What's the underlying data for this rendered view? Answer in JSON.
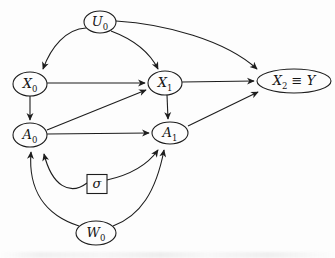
{
  "figure": {
    "background": "#fdfdfd",
    "stroke_color": "#1d1d1d",
    "text_color": "#141414",
    "type": "causal-dag",
    "nodes": [
      {
        "id": "U0",
        "shape": "ellipse",
        "cx": 100,
        "cy": 22,
        "rx": 16,
        "ry": 11,
        "label": [
          {
            "t": "U",
            "i": 1
          },
          {
            "t": "0",
            "s": 1
          }
        ]
      },
      {
        "id": "X0",
        "shape": "ellipse",
        "cx": 30,
        "cy": 84,
        "rx": 17,
        "ry": 12,
        "label": [
          {
            "t": "X",
            "i": 1
          },
          {
            "t": "0",
            "s": 1
          }
        ]
      },
      {
        "id": "X1",
        "shape": "ellipse",
        "cx": 165,
        "cy": 83,
        "rx": 17,
        "ry": 12,
        "label": [
          {
            "t": "X",
            "i": 1
          },
          {
            "t": "1",
            "s": 1
          }
        ]
      },
      {
        "id": "X2Y",
        "shape": "ellipse",
        "cx": 294,
        "cy": 81,
        "rx": 37,
        "ry": 12,
        "fs": 13,
        "label": [
          {
            "t": "X",
            "i": 1
          },
          {
            "t": "2",
            "s": 1
          },
          {
            "t": " ≡ ",
            "n": 1
          },
          {
            "t": "Y",
            "i": 1
          }
        ]
      },
      {
        "id": "A0",
        "shape": "ellipse",
        "cx": 30,
        "cy": 135,
        "rx": 17,
        "ry": 12,
        "label": [
          {
            "t": "A",
            "i": 1
          },
          {
            "t": "0",
            "s": 1
          }
        ]
      },
      {
        "id": "A1",
        "shape": "ellipse",
        "cx": 170,
        "cy": 133,
        "rx": 18,
        "ry": 11,
        "label": [
          {
            "t": "A",
            "i": 1
          },
          {
            "t": "1",
            "s": 1
          }
        ]
      },
      {
        "id": "sigma",
        "shape": "rect",
        "cx": 97,
        "cy": 184,
        "w": 20,
        "h": 19,
        "fs": 12,
        "label": [
          {
            "t": "σ",
            "i": 1
          }
        ]
      },
      {
        "id": "W0",
        "shape": "ellipse",
        "cx": 96,
        "cy": 233,
        "rx": 20,
        "ry": 12,
        "label": [
          {
            "t": "W",
            "i": 1
          },
          {
            "t": "0",
            "s": 1
          }
        ]
      }
    ],
    "edges": [
      {
        "from": "U0",
        "to": "X0",
        "d": "M86,28 C66,29 51,47 43,69"
      },
      {
        "from": "U0",
        "to": "X1",
        "d": "M111,31 C135,40 150,53 158,69"
      },
      {
        "from": "U0",
        "to": "X2Y",
        "d": "M116,21 C165,24 225,40 257,69"
      },
      {
        "from": "X0",
        "to": "X1",
        "d": "M47,83 L145,83"
      },
      {
        "from": "X0",
        "to": "A0",
        "d": "M30,96 L30,120"
      },
      {
        "from": "A0",
        "to": "X1",
        "d": "M47,130 L146,90"
      },
      {
        "from": "A0",
        "to": "A1",
        "d": "M47,134 L149,133"
      },
      {
        "from": "X1",
        "to": "X2Y",
        "d": "M182,82 L254,81"
      },
      {
        "from": "X1",
        "to": "A1",
        "d": "M167,95 L168,119"
      },
      {
        "from": "A1",
        "to": "X2Y",
        "d": "M188,126 L258,92"
      },
      {
        "from": "sigma",
        "to": "A0",
        "d": "M87,183 C70,196 52,186 44,154"
      },
      {
        "from": "sigma",
        "to": "A1",
        "d": "M107,180 C125,176 146,167 158,150"
      },
      {
        "from": "W0",
        "to": "A0",
        "d": "M79,226 C45,215 28,190 31,152"
      },
      {
        "from": "W0",
        "to": "A1",
        "d": "M113,226 C140,216 156,192 164,150"
      }
    ]
  }
}
